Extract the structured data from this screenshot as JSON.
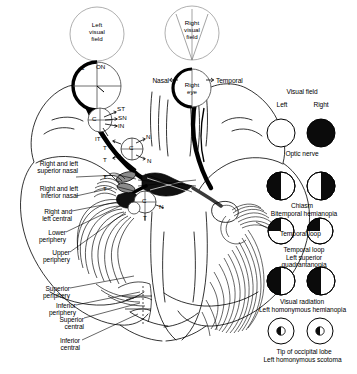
{
  "figure": {
    "colors": {
      "ink": "#000000",
      "paper": "#ffffff",
      "fill_dark": "#0b0b0b",
      "gray_fiber": "#6f6f6f"
    }
  },
  "top": {
    "left_visual_field": "Left\nvisual\nfield",
    "right_visual_field": "Right\nvisual\nfield",
    "right_eye": "Right\neye",
    "nasal": "Nasal",
    "temporal": "Temporal"
  },
  "retina_codes": {
    "c_optic_disc": "C",
    "on": "ON",
    "st": "ST",
    "sn": "SN",
    "in": "IN",
    "it": "IT",
    "t_upper": "T",
    "t_lower": "T",
    "c_chiasm_upper": "C",
    "n_upper": "N",
    "n_lower": "N",
    "c_retina": "C",
    "c_tract": "C",
    "n_tract": "N",
    "t_tract": "T",
    "t_nasal_upper": "T",
    "t_nasal_lower": "T"
  },
  "left_labels": [
    {
      "id": "right-and-left-superior-nasal",
      "text": "Right and left\nsuperior nasal"
    },
    {
      "id": "right-and-left-inferior-nasal",
      "text": "Right and left\ninferior nasal"
    },
    {
      "id": "right-and-left-central",
      "text": "Right and\nleft central"
    },
    {
      "id": "lower-periphery",
      "text": "Lower\nperiphery"
    },
    {
      "id": "upper-periphery",
      "text": "Upper\nperiphery"
    },
    {
      "id": "superior-periphery",
      "text": "Superior\nperiphery"
    },
    {
      "id": "inferior-periphery",
      "text": "Inferior\nperiphery"
    },
    {
      "id": "superior-central",
      "text": "Superior\ncentral"
    },
    {
      "id": "inferior-central",
      "text": "Inferior\ncentral"
    }
  ],
  "center_labels": {
    "temporal_loop": "Temporal loop"
  },
  "legend": {
    "heading": "Visual field",
    "left_eye_label": "Left",
    "right_eye_label": "Right",
    "rows": [
      {
        "id": "optic-nerve",
        "lesion": "Optic nerve",
        "defect": "",
        "left_pattern": "none",
        "right_pattern": "full"
      },
      {
        "id": "chiasm",
        "lesion": "Chiasm",
        "defect": "Bitemporal hemianopia",
        "left_pattern": "left-half",
        "right_pattern": "right-half"
      },
      {
        "id": "temporal-loop",
        "lesion": "Temporal loop",
        "defect": "Left superior\nquadrantanopia",
        "left_pattern": "upper-left-quadrant",
        "right_pattern": "upper-left-quadrant"
      },
      {
        "id": "visual-radiation",
        "lesion": "Visual radiation",
        "defect": "Left homonymous hemianopia",
        "left_pattern": "left-half",
        "right_pattern": "left-half"
      },
      {
        "id": "tip-of-occipital-lobe",
        "lesion": "Tip of occipital lobe",
        "defect": "Left homonymous scotoma",
        "left_pattern": "central-left-scotoma",
        "right_pattern": "central-left-scotoma"
      }
    ]
  }
}
